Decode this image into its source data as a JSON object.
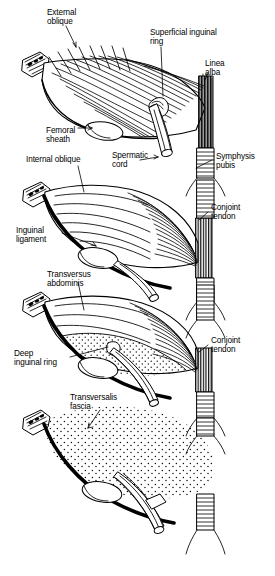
{
  "figure": {
    "type": "anatomical-line-illustration",
    "panel_count": 4,
    "ink_color": "#000000",
    "background_color": "#ffffff"
  },
  "panels": [
    {
      "id": "panel-1",
      "layer": "External oblique aponeurosis",
      "labels": [
        {
          "id": "external-oblique",
          "text": "External\noblique",
          "x": 47,
          "y": 8
        },
        {
          "id": "superficial-inguinal-ring",
          "text": "Superficial inguinal\nring",
          "x": 150,
          "y": 28
        },
        {
          "id": "linea-alba",
          "text": "Linea\nalba",
          "x": 205,
          "y": 59
        },
        {
          "id": "femoral-sheath",
          "text": "Femoral\nsheath",
          "x": 46,
          "y": 126
        }
      ]
    },
    {
      "id": "panel-2",
      "layer": "Internal oblique",
      "labels": [
        {
          "id": "spermatic-cord",
          "text": "Spermatic\ncord",
          "x": 112,
          "y": 151
        },
        {
          "id": "symphysis-pubis",
          "text": "Symphysis\npubis",
          "x": 216,
          "y": 152
        },
        {
          "id": "internal-oblique",
          "text": "Internal oblique",
          "x": 26,
          "y": 155
        },
        {
          "id": "conjoint-tendon-1",
          "text": "Conjoint\ntendon",
          "x": 211,
          "y": 203
        },
        {
          "id": "inguinal-ligament",
          "text": "Inguinal\nligament",
          "x": 16,
          "y": 226
        }
      ]
    },
    {
      "id": "panel-3",
      "layer": "Transversus abdominis",
      "labels": [
        {
          "id": "transversus-abdominis",
          "text": "Transversus\nabdominis",
          "x": 47,
          "y": 270
        },
        {
          "id": "deep-inguinal-ring",
          "text": "Deep\ninguinal ring",
          "x": 14,
          "y": 349
        },
        {
          "id": "conjoint-tendon-2",
          "text": "Conjoint\ntendon",
          "x": 211,
          "y": 336
        }
      ]
    },
    {
      "id": "panel-4",
      "layer": "Transversalis fascia",
      "labels": [
        {
          "id": "transversalis-fascia",
          "text": "Transversalis\nfascia",
          "x": 70,
          "y": 393
        }
      ]
    }
  ]
}
